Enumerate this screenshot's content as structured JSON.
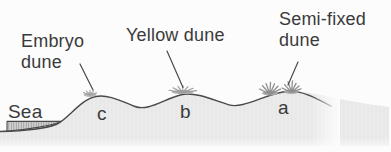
{
  "diagram": {
    "type": "cross-section",
    "labels": {
      "embryo_dune": "Embryo dune",
      "yellow_dune": "Yellow dune",
      "semi_fixed_dune": "Semi-fixed dune",
      "sea": "Sea"
    },
    "markers": {
      "a": "a",
      "b": "b",
      "c": "c"
    },
    "mapping": [
      {
        "marker": "c",
        "dune_type": "Embryo dune"
      },
      {
        "marker": "b",
        "dune_type": "Yellow dune"
      },
      {
        "marker": "a",
        "dune_type": "Semi-fixed dune"
      }
    ],
    "colors": {
      "text": "#3a3a3a",
      "outline": "#4a4a4a",
      "land_fill": "#e8e8e8",
      "sea_fill": "#d2d2d2",
      "sea_hatch": "#9e9e9e",
      "vegetation": "#8f8f8f",
      "background": "#fcfcfc"
    }
  }
}
